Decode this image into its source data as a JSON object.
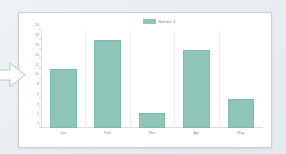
{
  "chart_data": {
    "type": "bar",
    "title": "",
    "subtitle": "",
    "xlabel": "",
    "ylabel": "",
    "categories": [
      "Jan",
      "Feb",
      "Mar",
      "Apr",
      "May"
    ],
    "values": [
      12,
      18,
      3,
      16,
      6
    ],
    "series": [
      {
        "name": "Series 1",
        "values": [
          12,
          18,
          3,
          16,
          6
        ]
      }
    ],
    "ylim": [
      0,
      20
    ],
    "yticks": [
      0,
      2,
      4,
      6,
      8,
      10,
      12,
      14,
      16,
      18,
      20
    ],
    "ytick_labels": [
      "0",
      "2",
      "4",
      "6",
      "8",
      "10",
      "12",
      "14",
      "16",
      "18",
      "20"
    ],
    "grid": true,
    "grid_axis": "x",
    "legend": {
      "position": "top-center",
      "entries": [
        {
          "label": "Series 1",
          "color": "#8fc5b8"
        }
      ]
    },
    "bar_color": "#8fc5b8",
    "bar_border_color": "#7fbbac",
    "plot_background": "#ffffff"
  },
  "page": {
    "background_color": "#eaeff2",
    "card_background": "#ffffff",
    "card_border_color": "#c9cfd4"
  },
  "annotation": {
    "arrow_name": "right-arrow-callout",
    "arrow_fill": "#ffffff",
    "arrow_stroke": "#b9c3ca"
  }
}
